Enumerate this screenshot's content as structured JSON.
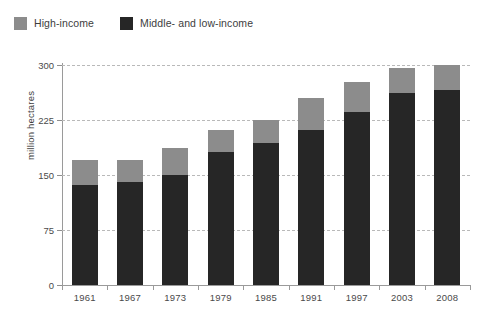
{
  "legend": {
    "position": "top-left",
    "entries": [
      {
        "label": "High-income",
        "color": "#8c8c8c",
        "key": "high"
      },
      {
        "label": "Middle- and low-income",
        "color": "#262626",
        "key": "low"
      }
    ]
  },
  "axes": {
    "ylabel": "million hectares",
    "xlabel": "",
    "yticks": [
      0,
      75,
      150,
      225,
      300
    ],
    "ytick_labels": [
      "0",
      "75",
      "150",
      "225",
      "300"
    ]
  },
  "chart_data": {
    "type": "bar",
    "stacked": true,
    "title": "",
    "subtitle": "",
    "xlabel": "",
    "ylabel": "million hectares",
    "categories": [
      "1961",
      "1967",
      "1973",
      "1979",
      "1985",
      "1991",
      "1997",
      "2003",
      "2008"
    ],
    "series": [
      {
        "name": "Middle- and low-income",
        "color": "#262626",
        "values": [
          136,
          140,
          150,
          181,
          194,
          211,
          236,
          262,
          266
        ]
      },
      {
        "name": "High-income",
        "color": "#8c8c8c",
        "values": [
          34,
          31,
          37,
          30,
          31,
          44,
          41,
          34,
          34
        ]
      }
    ],
    "totals": [
      170,
      171,
      187,
      211,
      225,
      255,
      277,
      296,
      300
    ],
    "ylim": [
      0,
      300
    ],
    "yticks": [
      0,
      75,
      150,
      225,
      300
    ],
    "grid": true,
    "grid_style": "dashed-horizontal",
    "legend_position": "top-left"
  },
  "style": {
    "background": "#ffffff",
    "grid_color": "#b9b9b9",
    "axis_color": "#9a9a9a",
    "text_color": "#3d3d3d"
  }
}
